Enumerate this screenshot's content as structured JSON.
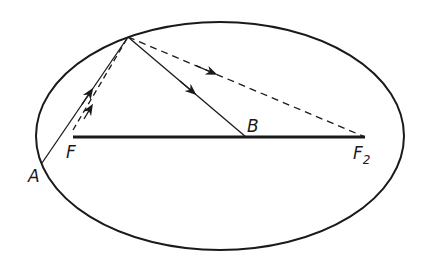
{
  "diagram": {
    "type": "ellipse-reflection",
    "ellipse": {
      "cx": 220,
      "cy": 136,
      "rx": 184,
      "ry": 114
    },
    "points": {
      "P": {
        "x": 128,
        "y": 37
      },
      "A": {
        "x": 42,
        "y": 163
      },
      "F": {
        "x": 73,
        "y": 137
      },
      "B": {
        "x": 246,
        "y": 137
      },
      "F2": {
        "x": 365,
        "y": 137
      }
    },
    "labels": {
      "A": "A",
      "F": "F",
      "B": "B",
      "F2_main": "F",
      "F2_sub": "2"
    },
    "colors": {
      "stroke": "#1a1a1a",
      "background": "#ffffff"
    }
  }
}
